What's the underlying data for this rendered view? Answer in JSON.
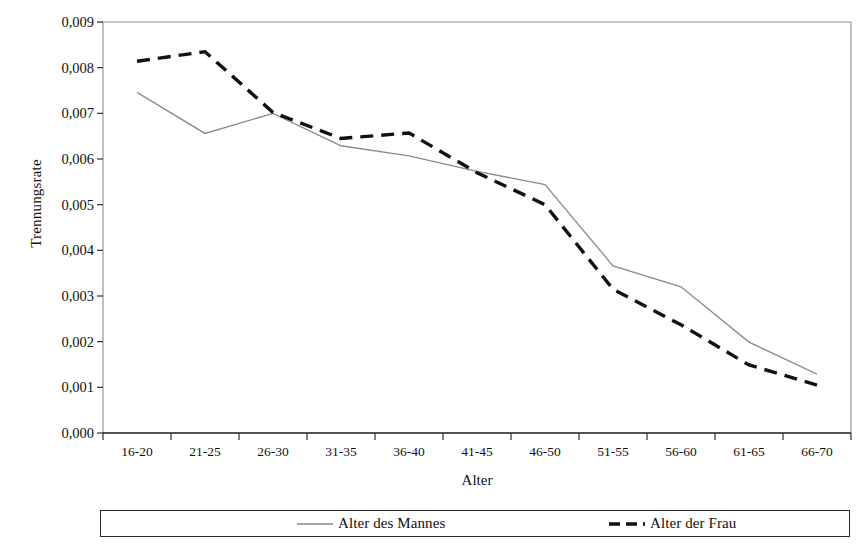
{
  "chart_data": {
    "type": "line",
    "title": "",
    "xlabel": "Alter",
    "ylabel": "Trennungsrate",
    "categories": [
      "16-20",
      "21-25",
      "26-30",
      "31-35",
      "36-40",
      "41-45",
      "46-50",
      "51-55",
      "56-60",
      "61-65",
      "66-70"
    ],
    "ylim": [
      0,
      0.009
    ],
    "y_ticks": [
      "0,000",
      "0,001",
      "0,002",
      "0,003",
      "0,004",
      "0,005",
      "0,006",
      "0,007",
      "0,008",
      "0,009"
    ],
    "y_tick_values": [
      0,
      0.001,
      0.002,
      0.003,
      0.004,
      0.005,
      0.006,
      0.007,
      0.008,
      0.009
    ],
    "grid": false,
    "legend_position": "bottom",
    "series": [
      {
        "name": "Alter des Mannes",
        "style": "solid",
        "color": "#8a8a8a",
        "width": 1.3,
        "values": [
          0.00746,
          0.00656,
          0.007,
          0.00629,
          0.00607,
          0.00573,
          0.00544,
          0.00366,
          0.0032,
          0.00199,
          0.00129
        ]
      },
      {
        "name": "Alter der Frau",
        "style": "dashed",
        "color": "#111111",
        "width": 3.4,
        "values": [
          0.00814,
          0.00835,
          0.00702,
          0.00645,
          0.00657,
          0.0057,
          0.005,
          0.00315,
          0.00237,
          0.00149,
          0.00105
        ]
      }
    ]
  },
  "axis": {
    "y_title": "Trennungsrate",
    "x_title": "Alter"
  },
  "legend": {
    "entries": [
      {
        "label": "Alter des Mannes",
        "style": "solid",
        "color": "#8a8a8a"
      },
      {
        "label": "Alter der Frau",
        "style": "dashed",
        "color": "#111111"
      }
    ]
  }
}
